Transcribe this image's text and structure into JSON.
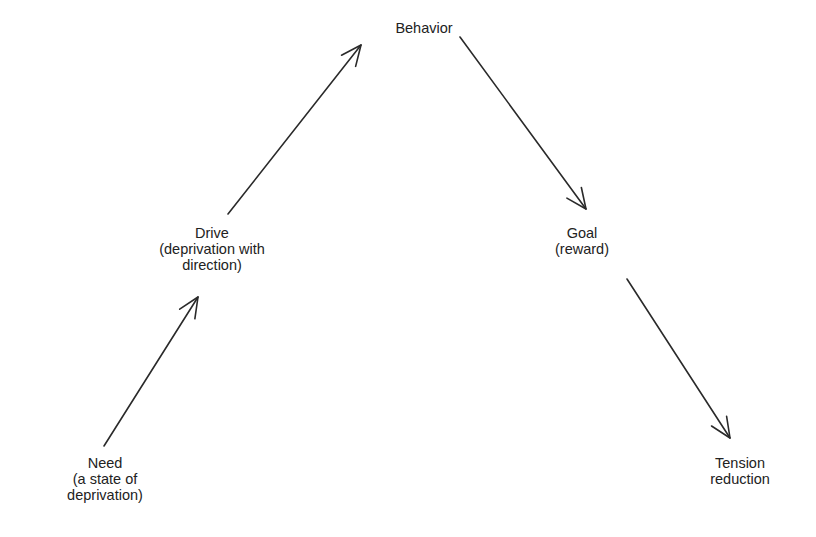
{
  "diagram": {
    "type": "flow",
    "nodes": [
      {
        "id": "need",
        "lines": [
          "Need",
          "(a state of",
          "deprivation)"
        ],
        "x": 105,
        "y": 455
      },
      {
        "id": "drive",
        "lines": [
          "Drive",
          "(deprivation with",
          "direction)"
        ],
        "x": 212,
        "y": 225
      },
      {
        "id": "behavior",
        "lines": [
          "Behavior"
        ],
        "x": 424,
        "y": 20
      },
      {
        "id": "goal",
        "lines": [
          "Goal",
          "(reward)"
        ],
        "x": 582,
        "y": 225
      },
      {
        "id": "tension",
        "lines": [
          "Tension",
          "reduction"
        ],
        "x": 740,
        "y": 455
      }
    ],
    "edges": [
      {
        "from": "need",
        "to": "drive",
        "x1": 104,
        "y1": 446,
        "x2": 198,
        "y2": 297
      },
      {
        "from": "drive",
        "to": "behavior",
        "x1": 228,
        "y1": 214,
        "x2": 361,
        "y2": 45
      },
      {
        "from": "behavior",
        "to": "goal",
        "x1": 460,
        "y1": 37,
        "x2": 586,
        "y2": 209
      },
      {
        "from": "goal",
        "to": "tension",
        "x1": 627,
        "y1": 279,
        "x2": 730,
        "y2": 438
      }
    ],
    "colors": {
      "background": "#ffffff",
      "stroke": "#2a2a2a",
      "text": "#222222"
    }
  }
}
